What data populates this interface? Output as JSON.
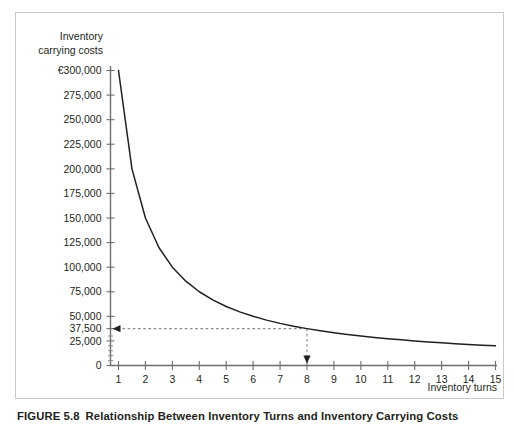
{
  "figure": {
    "number": "FIGURE 5.8",
    "caption": "Relationship Between Inventory Turns and Inventory Carrying Costs"
  },
  "axis_titles": {
    "y_line1": "Inventory",
    "y_line2": "carrying costs",
    "x": "Inventory turns"
  },
  "colors": {
    "curve": "#231f20",
    "axis": "#6d6e71",
    "guide": "#8a8b8e",
    "frame_border": "#c9c9c9",
    "text": "#231f20",
    "background": "#ffffff"
  },
  "chart_data": {
    "type": "line",
    "title": "Relationship Between Inventory Turns and Inventory Carrying Costs",
    "xlabel": "Inventory turns",
    "ylabel": "Inventory carrying costs",
    "xlim": [
      0,
      15
    ],
    "ylim": [
      0,
      300000
    ],
    "grid": false,
    "legend": "none",
    "currency_symbol": "€",
    "x_ticks": [
      1,
      2,
      3,
      4,
      5,
      6,
      7,
      8,
      9,
      10,
      11,
      12,
      13,
      14,
      15
    ],
    "x_tick_labels": [
      "1",
      "2",
      "3",
      "4",
      "5",
      "6",
      "7",
      "8",
      "9",
      "10",
      "11",
      "12",
      "13",
      "14",
      "15"
    ],
    "y_ticks": [
      0,
      25000,
      37500,
      50000,
      75000,
      100000,
      125000,
      150000,
      175000,
      200000,
      225000,
      250000,
      275000,
      300000
    ],
    "y_tick_labels": [
      "0",
      "25,000",
      "37,500",
      "50,000",
      "75,000",
      "100,000",
      "125,000",
      "150,000",
      "175,000",
      "200,000",
      "225,000",
      "250,000",
      "275,000",
      "€300,000"
    ],
    "y_minor_ticks": [
      5000,
      10000,
      15000,
      20000,
      30000
    ],
    "series": [
      {
        "name": "Inventory carrying costs",
        "relation": "y = 300000 / x",
        "x": [
          1,
          1.5,
          2,
          2.5,
          3,
          3.5,
          4,
          4.5,
          5,
          5.5,
          6,
          6.5,
          7,
          7.5,
          8,
          8.5,
          9,
          9.5,
          10,
          10.5,
          11,
          11.5,
          12,
          12.5,
          13,
          13.5,
          14,
          14.5,
          15
        ],
        "values": [
          300000,
          200000,
          150000,
          120000,
          100000,
          85714,
          75000,
          66667,
          60000,
          54545,
          50000,
          46154,
          42857,
          40000,
          37500,
          35294,
          33333,
          31579,
          30000,
          28571,
          27273,
          26087,
          25000,
          24000,
          23077,
          22222,
          21429,
          20690,
          20000
        ]
      }
    ],
    "annotations": [
      {
        "type": "guide-horizontal",
        "y_value": 37500,
        "label": "37,500",
        "from_x": 8,
        "to_x": 0,
        "arrow_at": "left",
        "style": "dashed"
      },
      {
        "type": "guide-vertical",
        "x_value": 8,
        "from_y": 37500,
        "to_y": 0,
        "arrow_at": "bottom",
        "style": "dashed"
      }
    ]
  }
}
